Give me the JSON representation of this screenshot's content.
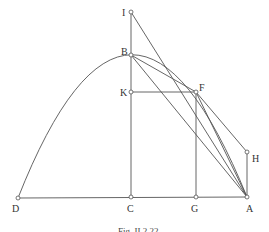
{
  "figure": {
    "caption": "Fig. II.2.22",
    "labels": {
      "I": "I",
      "B": "B",
      "K": "K",
      "F": "F",
      "H": "H",
      "D": "D",
      "C": "C",
      "G": "G",
      "A": "A"
    },
    "segments": [
      [
        "I",
        "C"
      ],
      [
        "D",
        "A"
      ],
      [
        "K",
        "F"
      ],
      [
        "F",
        "G"
      ],
      [
        "H",
        "A"
      ],
      [
        "I",
        "A"
      ],
      [
        "B",
        "F"
      ],
      [
        "B",
        "A"
      ],
      [
        "F",
        "A"
      ]
    ],
    "curve": "parabola through D, B, F, A"
  }
}
